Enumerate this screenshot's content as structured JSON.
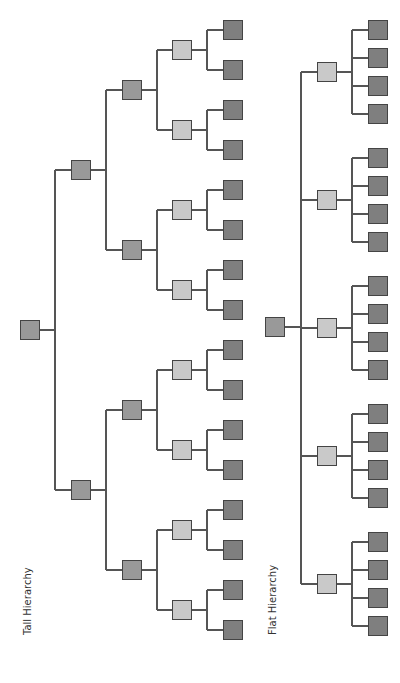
{
  "labels": {
    "tall": "Tall Hierarchy",
    "flat": "Flat Hierarchy"
  },
  "colors": {
    "leaf": "#7f7f7f",
    "mid": "#999999",
    "light": "#c9c9c9",
    "border": "#444444",
    "line": "#555555"
  },
  "tall_hierarchy": {
    "levels": 5,
    "branching": 2,
    "leaf_count": 16
  },
  "flat_hierarchy": {
    "levels": 3,
    "branches": 5,
    "leaves_per_branch": 4,
    "leaf_count": 20
  }
}
